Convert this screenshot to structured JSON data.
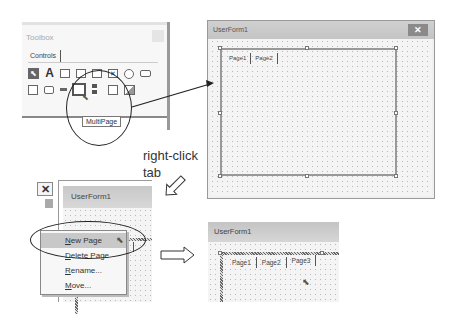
{
  "toolbox": {
    "title": "Toolbox",
    "tab": "Controls",
    "icons_row1": [
      "select-objects",
      "label",
      "textbox",
      "combobox",
      "listbox",
      "checkbox",
      "optionbutton",
      "togglebutton"
    ],
    "icons_row2": [
      "frame",
      "commandbutton",
      "tabstrip",
      "multipage",
      "scrollbar",
      "spinbutton",
      "image"
    ],
    "tooltip": "MultiPage"
  },
  "userform_big": {
    "title": "UserForm1",
    "close": "✕",
    "tabs": [
      "Page1",
      "Page2"
    ]
  },
  "annotation": {
    "line1": "right-click",
    "line2": "tab"
  },
  "userform_left": {
    "title": "UserForm1",
    "close": "✕",
    "tabs": [
      "Page1",
      "Page2"
    ]
  },
  "context_menu": {
    "items": [
      {
        "label": "New Page",
        "accel": "N",
        "rest": "ew Page",
        "highlighted": true
      },
      {
        "label": "Delete Page",
        "accel": "D",
        "rest": "elete Page",
        "highlighted": false
      },
      {
        "label": "Rename...",
        "accel": "R",
        "rest": "ename...",
        "highlighted": false
      },
      {
        "label": "Move...",
        "accel": "M",
        "rest": "ove...",
        "highlighted": false
      }
    ]
  },
  "userform_right": {
    "title": "UserForm1",
    "tabs": [
      "Page1",
      "Page2",
      "Page3"
    ]
  },
  "colors": {
    "titlebar": "#c8c8c8",
    "highlight": "#c8c8c8",
    "arrow": "#222222"
  }
}
